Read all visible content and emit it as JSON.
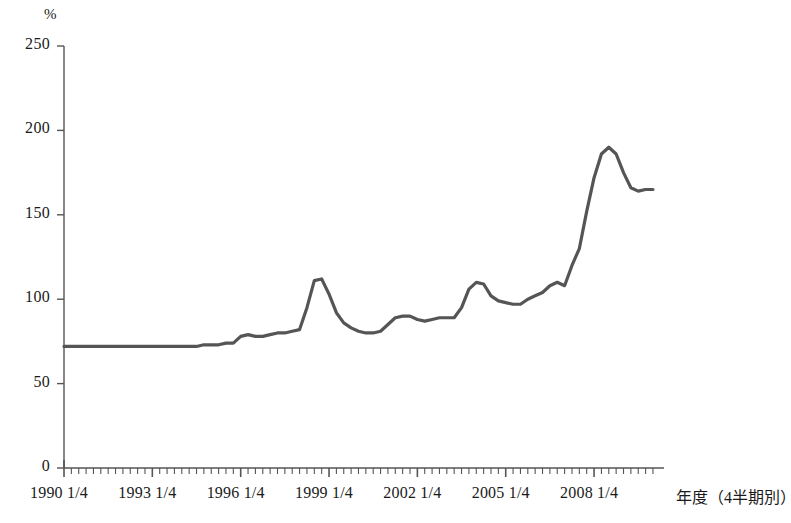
{
  "chart_data": {
    "type": "line",
    "title": "",
    "subtitle": "",
    "xlabel": "年度（4半期別）",
    "ylabel": "%",
    "ylim": [
      0,
      250
    ],
    "ytick_labels": [
      "0",
      "50",
      "100",
      "150",
      "200",
      "250"
    ],
    "ytick_values": [
      0,
      50,
      100,
      150,
      200,
      250
    ],
    "xtick_labels": [
      "1990 1/4",
      "1993 1/4",
      "1996 1/4",
      "1999 1/4",
      "2002 1/4",
      "2005 1/4",
      "2008 1/4"
    ],
    "xtick_quarter_index": [
      0,
      12,
      24,
      36,
      48,
      60,
      72
    ],
    "grid": false,
    "legend": "none",
    "line_color": "#555555",
    "axis_color": "#555555",
    "x_start_label": "1990 1/4",
    "x_quarters_total": 81,
    "series": [
      {
        "name": "比率",
        "values": [
          72,
          72,
          72,
          72,
          72,
          72,
          72,
          72,
          72,
          72,
          72,
          72,
          72,
          72,
          72,
          72,
          72,
          72,
          72,
          73,
          73,
          73,
          74,
          74,
          78,
          79,
          78,
          78,
          79,
          80,
          80,
          81,
          82,
          95,
          111,
          112,
          103,
          92,
          86,
          83,
          81,
          80,
          80,
          81,
          85,
          89,
          90,
          90,
          88,
          87,
          88,
          89,
          89,
          89,
          95,
          106,
          110,
          109,
          102,
          99,
          98,
          97,
          97,
          100,
          102,
          104,
          108,
          110,
          108,
          120,
          130,
          152,
          172,
          186,
          190,
          186,
          175,
          166,
          164,
          165,
          165
        ]
      }
    ]
  },
  "axis": {
    "y_unit": "%",
    "x_title": "年度（4半期別）"
  }
}
